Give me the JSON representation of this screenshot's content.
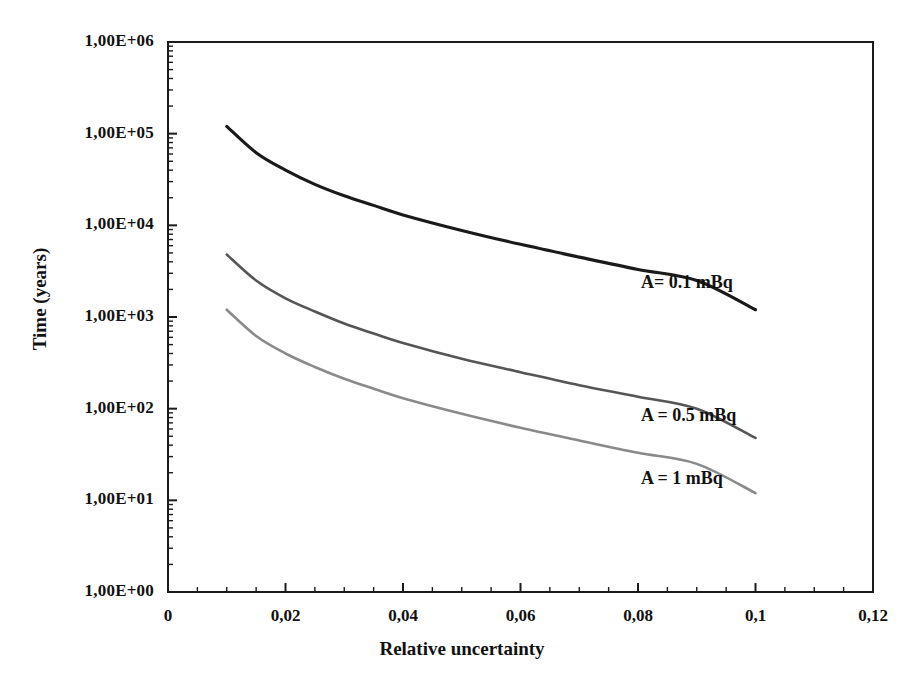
{
  "chart_data": {
    "type": "line",
    "title": "",
    "xlabel": "Relative uncertainty",
    "ylabel": "Time (years)",
    "yscale": "log",
    "xscale": "linear",
    "xlim": [
      0,
      0.12
    ],
    "ylim": [
      1,
      1000000
    ],
    "grid": false,
    "legend_position": "inline-annotations",
    "x_tick_labels": [
      "0",
      "0,02",
      "0,04",
      "0,06",
      "0,08",
      "0,1",
      "0,12"
    ],
    "x_tick_values": [
      0,
      0.02,
      0.04,
      0.06,
      0.08,
      0.1,
      0.12
    ],
    "x_minor_tick_step": 0.005,
    "y_tick_labels": [
      "1,00E+06",
      "1,00E+05",
      "1,00E+04",
      "1,00E+03",
      "1,00E+02",
      "1,00E+01",
      "1,00E+00"
    ],
    "y_tick_values": [
      1000000,
      100000,
      10000,
      1000,
      100,
      10,
      1
    ],
    "x": [
      0.01,
      0.015,
      0.02,
      0.025,
      0.03,
      0.035,
      0.04,
      0.05,
      0.06,
      0.07,
      0.08,
      0.09,
      0.1
    ],
    "series": [
      {
        "name": "A= 0.1 mBq",
        "color": "#1a1a1a",
        "annotation": "A= 0.1 mBq",
        "values": [
          120000,
          62000,
          40000,
          28000,
          21000,
          16500,
          13000,
          8800,
          6200,
          4500,
          3300,
          2500,
          1200
        ]
      },
      {
        "name": "A = 0.5 mBq",
        "color": "#555555",
        "annotation": "A = 0.5 mBq",
        "values": [
          4800,
          2500,
          1600,
          1150,
          850,
          660,
          520,
          350,
          250,
          180,
          135,
          100,
          48
        ]
      },
      {
        "name": "A = 1 mBq",
        "color": "#8a8a8a",
        "annotation": "A = 1 mBq",
        "values": [
          1200,
          620,
          400,
          285,
          212,
          165,
          130,
          88,
          62,
          45,
          33,
          25,
          12
        ]
      }
    ]
  },
  "axes": {
    "y_title": "Time (years)",
    "x_title": "Relative uncertainty",
    "y_labels": [
      "1,00E+06",
      "1,00E+05",
      "1,00E+04",
      "1,00E+03",
      "1,00E+02",
      "1,00E+01",
      "1,00E+00"
    ],
    "x_labels": [
      "0",
      "0,02",
      "0,04",
      "0,06",
      "0,08",
      "0,1",
      "0,12"
    ]
  },
  "annotations": {
    "series_a": "A= 0.1 mBq",
    "series_b": "A = 0.5 mBq",
    "series_c": "A = 1 mBq"
  },
  "colors": {
    "axis": "#1a1a1a",
    "series_a": "#1a1a1a",
    "series_b": "#555555",
    "series_c": "#8a8a8a",
    "background": "#ffffff"
  }
}
